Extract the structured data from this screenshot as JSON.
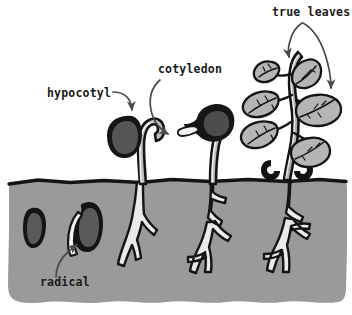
{
  "diagram": {
    "type": "biology-illustration",
    "colors": {
      "background": "#ffffff",
      "soil": "#9a9a9a",
      "soil_edge": "#1a1a1a",
      "seed_dark": "#1a1a1a",
      "seed_fill": "#4f4f4f",
      "stem_fill": "#b9b9b9",
      "stem_highlight": "#f2f2f2",
      "leaf_fill": "#b5b5b5",
      "root_fill": "#e8e8e8",
      "outline": "#111111",
      "arrow": "#4a4a4a",
      "label_text": "#1a1a1a"
    },
    "labels": [
      {
        "id": "hypocotyl",
        "text": "hypocotyl",
        "x": 47,
        "y": 97
      },
      {
        "id": "cotyledon",
        "text": "cotyledon",
        "x": 158,
        "y": 73
      },
      {
        "id": "true-leaves",
        "text": "true leaves",
        "x": 272,
        "y": 16
      },
      {
        "id": "radical",
        "text": "radical",
        "x": 40,
        "y": 286
      }
    ],
    "stages": [
      {
        "id": "stage-1",
        "name": "dormant-seed",
        "description": "ungerminated seed buried in soil"
      },
      {
        "id": "stage-2",
        "name": "radicle-emergence",
        "description": "seed with radicle emerging downward"
      },
      {
        "id": "stage-3",
        "name": "hypocotyl-hook",
        "description": "seedling with hooked hypocotyl and attached seed coat"
      },
      {
        "id": "stage-4",
        "name": "cotyledon-opening",
        "description": "seedling with cotyledons opening above soil"
      },
      {
        "id": "stage-5",
        "name": "true-leaves-plant",
        "description": "mature seedling with six true leaves and spent cotyledons"
      }
    ],
    "soil": {
      "surface_y": 181,
      "bottom_y": 303,
      "left_x": 8,
      "right_x": 347
    }
  }
}
